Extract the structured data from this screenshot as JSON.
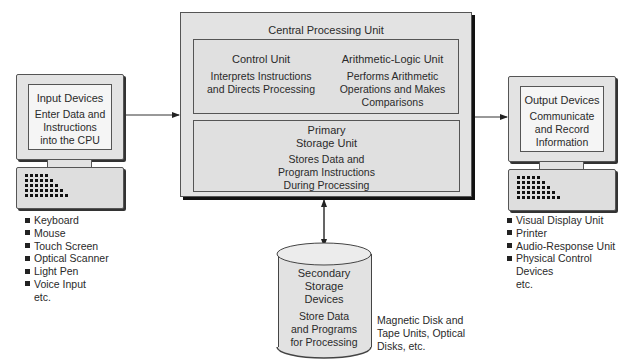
{
  "cpu": {
    "title": "Central Processing Unit",
    "control_unit": {
      "title": "Control Unit",
      "desc": [
        "Interprets Instructions",
        "and Directs Processing"
      ]
    },
    "alu": {
      "title": "Arithmetic-Logic Unit",
      "desc": [
        "Performs Arithmetic",
        "Operations and Makes",
        "Comparisons"
      ]
    },
    "primary_storage": {
      "title": [
        "Primary",
        "Storage Unit"
      ],
      "desc": [
        "Stores Data and",
        "Program Instructions",
        "During Processing"
      ]
    }
  },
  "input": {
    "title": "Input Devices",
    "desc": [
      "Enter Data and",
      "Instructions",
      "into the CPU"
    ],
    "examples": [
      "Keyboard",
      "Mouse",
      "Touch Screen",
      "Optical Scanner",
      "Light Pen",
      "Voice Input"
    ],
    "etc": "etc."
  },
  "output": {
    "title": "Output Devices",
    "desc": [
      "Communicate",
      "and Record",
      "Information"
    ],
    "examples": [
      "Visual Display Unit",
      "Printer",
      "Audio-Response Unit",
      "Physical Control"
    ],
    "examples_cont": "Devices",
    "etc": "etc."
  },
  "secondary": {
    "title": [
      "Secondary",
      "Storage",
      "Devices"
    ],
    "desc": [
      "Store Data",
      "and Programs",
      "for Processing"
    ],
    "examples": [
      "Magnetic Disk and",
      "Tape Units, Optical",
      "Disks, etc."
    ]
  },
  "colors": {
    "box_fill": "#e3e3e3",
    "line": "#555555",
    "shadow": "#111111",
    "screen": "#f5f5f5"
  },
  "icons": {
    "input_monitor": "computer-monitor-icon",
    "input_keyboard": "keyboard-icon",
    "output_monitor": "computer-monitor-icon",
    "output_keyboard": "keyboard-icon",
    "secondary": "disk-cylinder-icon",
    "bullet": "square-bullet-icon"
  }
}
